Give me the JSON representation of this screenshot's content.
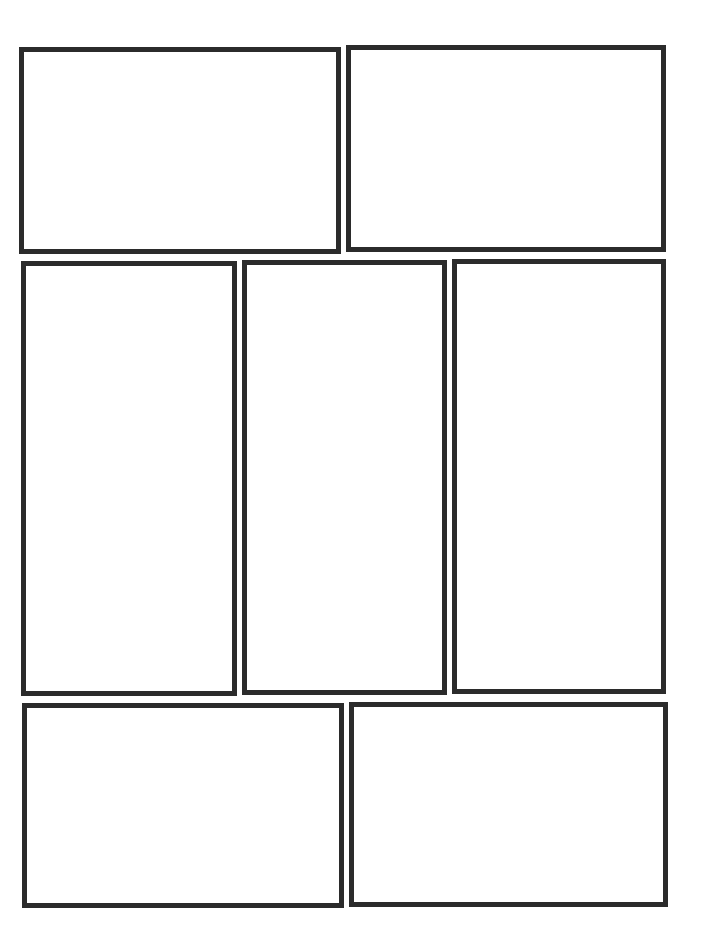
{
  "page": {
    "type": "comic-page-template",
    "background": "#ffffff",
    "border_color": "#2b2b2b",
    "panel_count": 7
  },
  "panels": [
    {
      "id": "panel-1",
      "row": 1,
      "label": "",
      "left": 19,
      "top": 47,
      "width": 322,
      "height": 207
    },
    {
      "id": "panel-2",
      "row": 1,
      "label": "",
      "left": 346,
      "top": 45,
      "width": 320,
      "height": 207
    },
    {
      "id": "panel-3",
      "row": 2,
      "label": "",
      "left": 21,
      "top": 261,
      "width": 216,
      "height": 435
    },
    {
      "id": "panel-4",
      "row": 2,
      "label": "",
      "left": 242,
      "top": 260,
      "width": 205,
      "height": 435
    },
    {
      "id": "panel-5",
      "row": 2,
      "label": "",
      "left": 452,
      "top": 259,
      "width": 214,
      "height": 435
    },
    {
      "id": "panel-6",
      "row": 3,
      "label": "",
      "left": 22,
      "top": 703,
      "width": 322,
      "height": 205
    },
    {
      "id": "panel-7",
      "row": 3,
      "label": "",
      "left": 349,
      "top": 702,
      "width": 319,
      "height": 205
    }
  ]
}
